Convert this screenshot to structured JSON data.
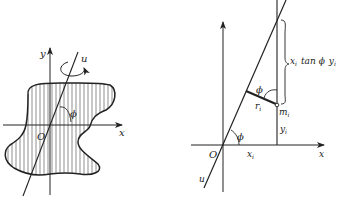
{
  "figure_left": {
    "axis_x_label": "x",
    "axis_y_label": "y",
    "axis_u_label": "u",
    "origin_label": "O",
    "angle_label": "ϕ",
    "rotation_arrow": "rotation-about-u"
  },
  "figure_right": {
    "axis_x_label": "x",
    "axis_u_label": "u",
    "origin_label": "O",
    "angle_label_origin": "ϕ",
    "angle_label_mass": "ϕ",
    "distance_label": "r",
    "distance_sub": "i",
    "mass_label": "m",
    "mass_sub": "i",
    "xi_label": "x",
    "xi_sub": "i",
    "yi_label": "y",
    "yi_sub": "i",
    "brace_expr": {
      "x": "x",
      "x_sub": "i",
      "tan": "tan ϕ",
      "y": "y",
      "y_sub": "i"
    }
  },
  "colors": {
    "ink": "#222222",
    "background": "#ffffff"
  }
}
